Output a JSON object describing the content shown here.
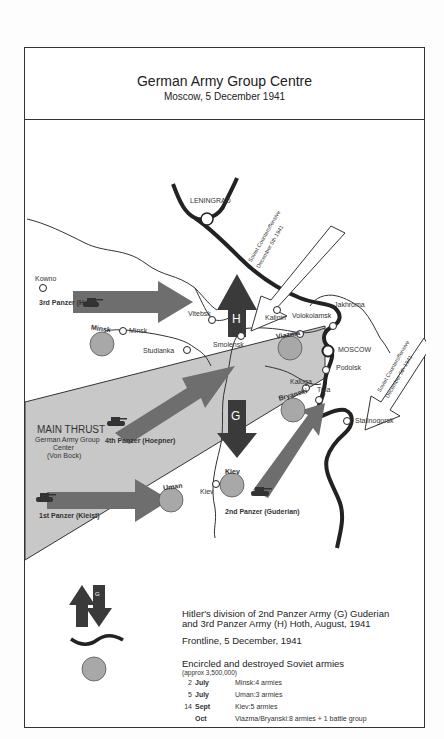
{
  "header": {
    "title": "German Army Group Centre",
    "subtitle": "Moscow, 5 December 1941"
  },
  "colors": {
    "arrow_dark": "#3a3a3a",
    "arrow_medium": "#6e6e6e",
    "main_thrust_fill": "#c8c8c8",
    "encircled_fill": "#a8a8a8",
    "frontline": "#222222"
  },
  "cities": {
    "leningrad": "LENINGRAD",
    "kowno": "Kowno",
    "minsk": "Minsk",
    "vitebsk": "Vitebsk",
    "smolensk": "Smolensk",
    "studianka": "Studianka",
    "kalinin": "Kalinin",
    "jakhroma": "Jakhroma",
    "volokolamsk": "Volokolamsk",
    "moscow": "MOSCOW",
    "podolsk": "Podolsk",
    "kaluga": "Kaluga",
    "tula": "Tula",
    "stalinogorsk": "Stalinogorsk",
    "kiev": "Kiev"
  },
  "pockets": {
    "minsk": "Minsk",
    "viazma": "Viazma",
    "bryanski": "Bryanski",
    "uman": "Uman",
    "kiev": "Kiev"
  },
  "armies": {
    "third_panzer": "3rd Panzer (Hoth)",
    "fourth_panzer": "4th Panzer (Hoepner)",
    "first_panzer": "1st Panzer (Kleist)",
    "second_panzer": "2nd Panzer (Guderian)",
    "h_letter": "H",
    "g_letter": "G"
  },
  "main_thrust": {
    "title": "MAIN THRUST",
    "line1": "German Army Group",
    "line2": "Center",
    "line3": "(Von Bock)"
  },
  "counteroffensive": {
    "line1": "Soviet Counteroffensive",
    "line2": "December 5th 1941"
  },
  "legend": {
    "division_line1": "Hitler's division of 2nd Panzer Army (G) Guderian",
    "division_line2": "and 3rd Panzer Army (H) Hoth, August, 1941",
    "h_letter": "H",
    "g_letter": "G",
    "frontline": "Frontline, 5 December, 1941",
    "encircled_title": "Encircled and destroyed Soviet armies",
    "encircled_sub": "(approx 3,500,000)",
    "events": [
      {
        "day": "2",
        "month": "July",
        "desc": "Minsk:4 armies"
      },
      {
        "day": "5",
        "month": "July",
        "desc": "Uman:3 armies"
      },
      {
        "day": "14",
        "month": "Sept",
        "desc": "Kiev:5 armies"
      },
      {
        "day": "",
        "month": "Oct",
        "desc": "Viazma/Bryanski:8 armies + 1 battle group"
      }
    ]
  }
}
